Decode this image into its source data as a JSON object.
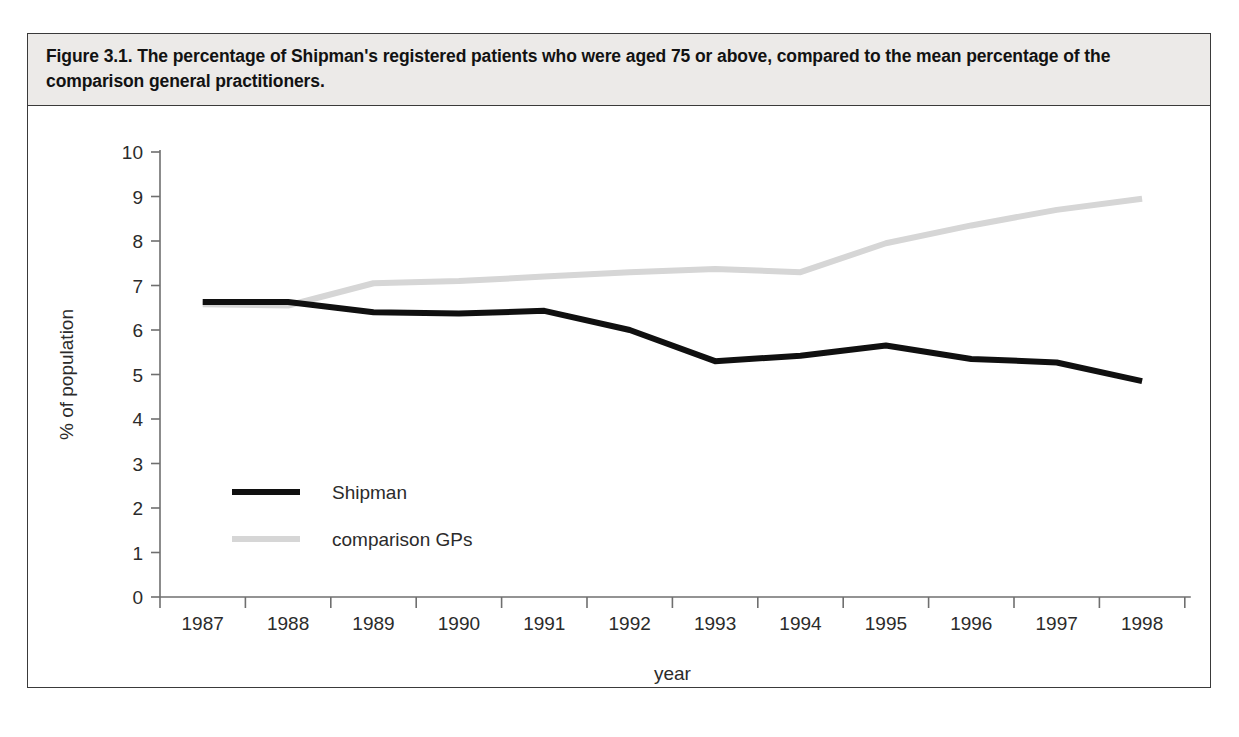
{
  "figure": {
    "caption": "Figure 3.1. The percentage of Shipman's registered patients who were aged 75 or above, compared to the mean percentage of the comparison general practitioners."
  },
  "colors": {
    "shipman_line": "#101010",
    "comparison_line": "#d6d6d6",
    "axis": "#6f6f6f",
    "frame": "#3a3a3a",
    "caption_background": "#eceae8",
    "text": "#2b2b2b"
  },
  "chart_data": {
    "type": "line",
    "title": "Figure 3.1. The percentage of Shipman's registered patients who were aged 75 or above, compared to the mean percentage of the comparison general practitioners.",
    "xlabel": "year",
    "ylabel": "% of population",
    "categories": [
      "1987",
      "1988",
      "1989",
      "1990",
      "1991",
      "1992",
      "1993",
      "1994",
      "1995",
      "1996",
      "1997",
      "1998"
    ],
    "xlim": [
      1987,
      1998
    ],
    "ylim": [
      0,
      10
    ],
    "yticks": [
      0,
      1,
      2,
      3,
      4,
      5,
      6,
      7,
      8,
      9,
      10
    ],
    "ytick_labels": [
      "0",
      "1",
      "2",
      "3",
      "4",
      "5",
      "6",
      "7",
      "8",
      "9",
      "10"
    ],
    "grid": false,
    "legend_position": "center-left",
    "series": [
      {
        "name": "Shipman",
        "color": "#101010",
        "width": 6,
        "values": [
          6.63,
          6.63,
          6.4,
          6.37,
          6.43,
          6.0,
          5.3,
          5.42,
          5.65,
          5.35,
          5.27,
          4.85
        ]
      },
      {
        "name": "comparison GPs",
        "color": "#d6d6d6",
        "width": 6,
        "values": [
          6.58,
          6.55,
          7.05,
          7.1,
          7.2,
          7.3,
          7.37,
          7.3,
          7.95,
          8.35,
          8.7,
          8.95
        ]
      }
    ]
  },
  "legend": {
    "items": [
      {
        "label": "Shipman",
        "color": "#101010"
      },
      {
        "label": "comparison GPs",
        "color": "#d6d6d6"
      }
    ]
  }
}
